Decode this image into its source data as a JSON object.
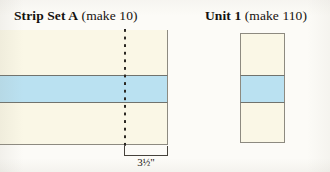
{
  "page": {
    "background_color": "#fcfbf7",
    "paper_tone": "scanned-book-page"
  },
  "diagram": {
    "title_left": {
      "bold": "Strip Set A",
      "rest": " (make 10)"
    },
    "title_right": {
      "bold": "Unit 1",
      "rest": " (make 110)"
    },
    "strip_set_a": {
      "name": "Strip Set A",
      "quantity_text": "(make 10)",
      "quantity": 10,
      "bands": [
        {
          "fabric": "cream",
          "color": "#faf7e6"
        },
        {
          "fabric": "light-blue",
          "color": "#bae1f1"
        },
        {
          "fabric": "cream",
          "color": "#faf7e6"
        }
      ],
      "cut_line": "vertical dashed cutting line",
      "measurement": {
        "whole": "3",
        "fraction": "½",
        "unit": "\"",
        "full_text": "3½\""
      }
    },
    "unit_1": {
      "name": "Unit 1",
      "quantity_text": "(make 110)",
      "quantity": 110,
      "bands": [
        {
          "fabric": "cream",
          "color": "#faf7e6"
        },
        {
          "fabric": "light-blue",
          "color": "#bae1f1"
        },
        {
          "fabric": "cream",
          "color": "#faf7e6"
        }
      ]
    }
  }
}
